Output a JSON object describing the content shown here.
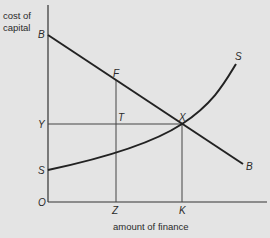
{
  "diagram": {
    "y_axis_label_line1": "cost of",
    "y_axis_label_line2": "capital",
    "x_axis_label": "amount of finance",
    "points": {
      "B_top": "B",
      "F": "F",
      "S_top": "S",
      "Y": "Y",
      "T": "T",
      "X": "X",
      "B_end": "B",
      "S_low": "S",
      "O": "O",
      "Z": "Z",
      "K": "K"
    },
    "curves": [
      {
        "name": "B",
        "description": "downward-sloping line from B on y-axis through F and X to B"
      },
      {
        "name": "S",
        "description": "upward-sloping convex curve from S on y-axis through X to S"
      }
    ],
    "guides": [
      {
        "from": "Y",
        "to": "X",
        "type": "horizontal"
      },
      {
        "from": "F",
        "to": "Z",
        "type": "vertical"
      },
      {
        "from": "X",
        "to": "K",
        "type": "vertical"
      }
    ],
    "colors": {
      "background": "#e4e4e4",
      "ink": "#222222"
    }
  }
}
